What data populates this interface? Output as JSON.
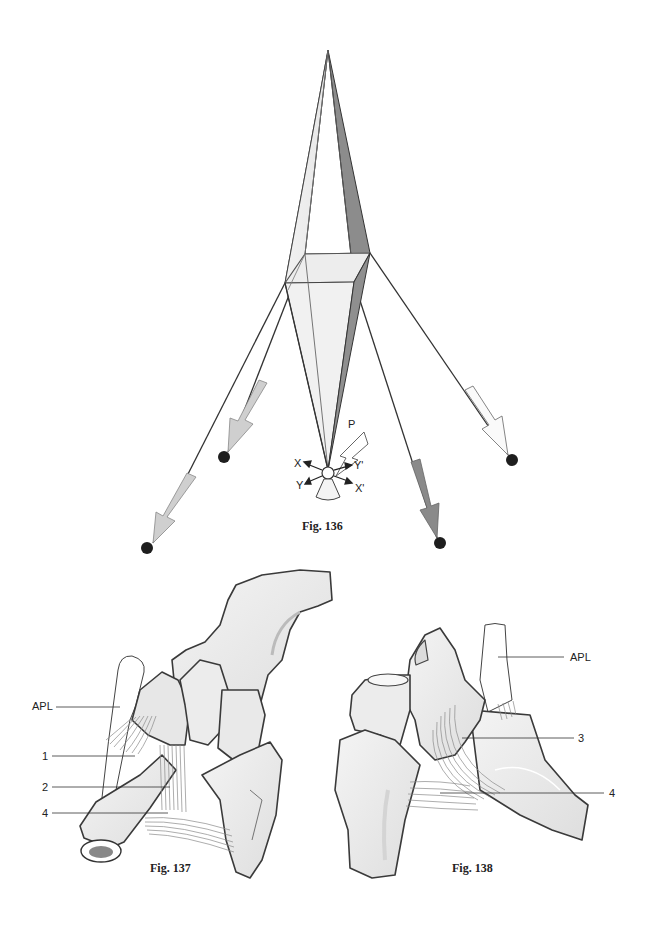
{
  "figures": [
    {
      "id": "fig136",
      "caption": "Fig. 136",
      "description": "Tent-like bipyramid model with four guy ropes and force arrows",
      "axis_labels": {
        "x": "X",
        "y": "Y",
        "x_prime": "X'",
        "y_prime": "Y'",
        "p": "P"
      },
      "arrows": [
        {
          "name": "left-outer",
          "shade": "light-gray"
        },
        {
          "name": "left-inner",
          "shade": "light-gray"
        },
        {
          "name": "right-inner",
          "shade": "dark-gray"
        },
        {
          "name": "right-outer",
          "shade": "white"
        }
      ]
    },
    {
      "id": "fig137",
      "caption": "Fig. 137",
      "labels": [
        "APL",
        "1",
        "2",
        "4"
      ]
    },
    {
      "id": "fig138",
      "caption": "Fig. 138",
      "labels": [
        "APL",
        "3",
        "4"
      ]
    }
  ],
  "colors": {
    "outline": "#333333",
    "bone_fill": "#ebebeb",
    "bone_shadow": "#d2d2d2",
    "dark_face": "#8c8c8c",
    "mid_arrow": "#cfcfcf",
    "dark_arrow": "#8a8a8a"
  }
}
